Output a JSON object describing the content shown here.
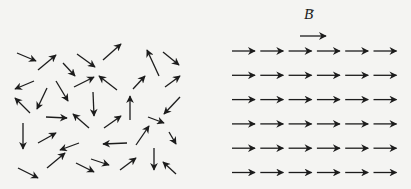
{
  "figure": {
    "field_label": "B",
    "field_label_vector_mark": "→",
    "colors": {
      "background": "#f4f4f2",
      "arrow": "#1c1c1c"
    },
    "left_panel": {
      "description": "randomly oriented dipoles (no field)",
      "arrows": [
        [
          17,
          53,
          36,
          61
        ],
        [
          38,
          70,
          56,
          55
        ],
        [
          63,
          63,
          75,
          76
        ],
        [
          77,
          54,
          95,
          67
        ],
        [
          103,
          60,
          121,
          44
        ],
        [
          159,
          76,
          147,
          50
        ],
        [
          163,
          52,
          179,
          65
        ],
        [
          34,
          81,
          15,
          89
        ],
        [
          56,
          81,
          68,
          101
        ],
        [
          74,
          87,
          94,
          77
        ],
        [
          117,
          90,
          99,
          76
        ],
        [
          133,
          89,
          145,
          76
        ],
        [
          165,
          87,
          180,
          76
        ],
        [
          30,
          113,
          15,
          98
        ],
        [
          47,
          88,
          37,
          109
        ],
        [
          93,
          92,
          94,
          116
        ],
        [
          130,
          120,
          130,
          96
        ],
        [
          148,
          117,
          164,
          123
        ],
        [
          180,
          97,
          164,
          114
        ],
        [
          46,
          117,
          67,
          118
        ],
        [
          89,
          128,
          73,
          114
        ],
        [
          104,
          128,
          121,
          116
        ],
        [
          169,
          132,
          176,
          144
        ],
        [
          23,
          123,
          23,
          149
        ],
        [
          38,
          143,
          56,
          133
        ],
        [
          79,
          143,
          60,
          150
        ],
        [
          127,
          143,
          103,
          144
        ],
        [
          136,
          145,
          149,
          126
        ],
        [
          154,
          148,
          154,
          170
        ],
        [
          91,
          159,
          109,
          165
        ],
        [
          47,
          168,
          65,
          153
        ],
        [
          76,
          163,
          94,
          172
        ],
        [
          120,
          170,
          136,
          158
        ],
        [
          18,
          168,
          38,
          178
        ],
        [
          176,
          174,
          163,
          162
        ]
      ]
    },
    "right_panel": {
      "description": "dipoles aligned with uniform field B",
      "rows": 6,
      "cols": 6,
      "origin_x": 232,
      "origin_y": 51,
      "spacing_x": 28.3,
      "spacing_y": 24.3,
      "arrow_length": 23
    },
    "field_arrow": [
      300,
      36,
      326,
      36
    ]
  }
}
